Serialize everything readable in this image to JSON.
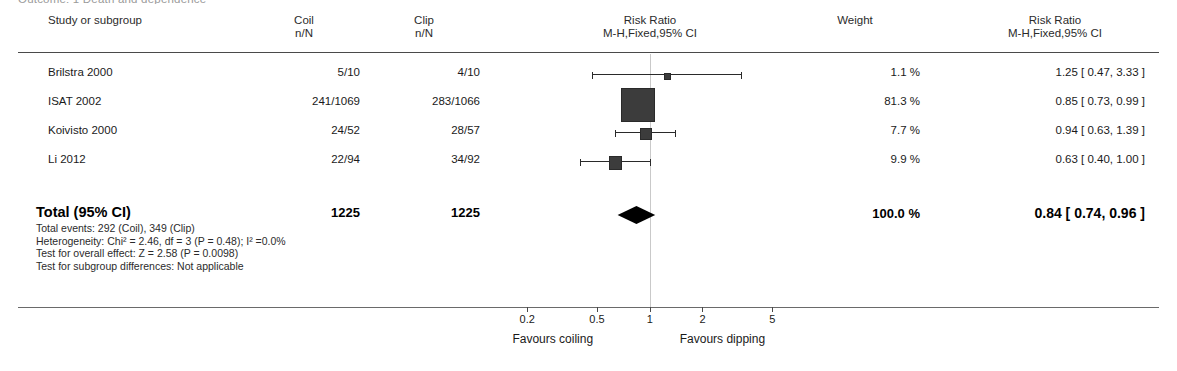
{
  "outcome_caption": "Outcome: 1 Death and dependence",
  "headers": {
    "study": "Study or subgroup",
    "coil_l1": "Coil",
    "coil_l2": "n/N",
    "clip_l1": "Clip",
    "clip_l2": "n/N",
    "plot_l1": "Risk Ratio",
    "plot_l2": "M-H,Fixed,95% CI",
    "weight": "Weight",
    "rr_l1": "Risk Ratio",
    "rr_l2": "M-H,Fixed,95% CI"
  },
  "rows": [
    {
      "study": "Brilstra 2000",
      "coil": "5/10",
      "clip": "4/10",
      "weight": "1.1 %",
      "rr_text": "1.25 [ 0.47, 3.33 ]",
      "estimate": 1.25,
      "ci_low": 0.47,
      "ci_high": 3.33,
      "weight_pct": 1.1
    },
    {
      "study": "ISAT 2002",
      "coil": "241/1069",
      "clip": "283/1066",
      "weight": "81.3 %",
      "rr_text": "0.85 [ 0.73, 0.99 ]",
      "estimate": 0.85,
      "ci_low": 0.73,
      "ci_high": 0.99,
      "weight_pct": 81.3
    },
    {
      "study": "Koivisto 2000",
      "coil": "24/52",
      "clip": "28/57",
      "weight": "7.7 %",
      "rr_text": "0.94 [ 0.63, 1.39 ]",
      "estimate": 0.94,
      "ci_low": 0.63,
      "ci_high": 1.39,
      "weight_pct": 7.7
    },
    {
      "study": "Li 2012",
      "coil": "22/94",
      "clip": "34/92",
      "weight": "9.9 %",
      "rr_text": "0.63 [ 0.40, 1.00 ]",
      "estimate": 0.63,
      "ci_low": 0.4,
      "ci_high": 1.0,
      "weight_pct": 9.9
    }
  ],
  "total": {
    "label": "Total (95% CI)",
    "coil_n": "1225",
    "clip_n": "1225",
    "weight": "100.0 %",
    "rr_text": "0.84 [ 0.74, 0.96 ]",
    "estimate": 0.84,
    "ci_low": 0.74,
    "ci_high": 0.96
  },
  "stats": [
    "Total events: 292 (Coil), 349 (Clip)",
    "Heterogeneity: Chi² = 2.46, df = 3 (P = 0.48); I² =0.0%",
    "Test for overall effect: Z = 2.58 (P = 0.0098)",
    "Test for subgroup differences: Not applicable"
  ],
  "axis": {
    "ticks": [
      "0.2",
      "0.5",
      "1",
      "2",
      "5"
    ],
    "tick_values": [
      0.2,
      0.5,
      1,
      2,
      5
    ],
    "favours_left": "Favours coiling",
    "favours_right": "Favours dipping",
    "scale": "log",
    "xmin": 0.14,
    "xmax": 7.2
  },
  "colors": {
    "marker": "#3c3c3c",
    "line": "#2a2a2a",
    "zeroline": "#c9c9c9",
    "rule": "#4a4a4a",
    "text": "#1a1a1a"
  },
  "chart_data": {
    "type": "scatter",
    "xlabel": "Risk Ratio (log scale)",
    "ylabel": "",
    "xlim": [
      0.14,
      7.2
    ],
    "grid": false,
    "legend": "none",
    "categories": [
      "Brilstra 2000",
      "ISAT 2002",
      "Koivisto 2000",
      "Li 2012",
      "Total (95% CI)"
    ],
    "values": [
      1.25,
      0.85,
      0.94,
      0.63,
      0.84
    ],
    "ci_low": [
      0.47,
      0.73,
      0.63,
      0.4,
      0.74
    ],
    "ci_high": [
      3.33,
      0.99,
      1.39,
      1.0,
      0.96
    ],
    "weights": [
      1.1,
      81.3,
      7.7,
      9.9,
      100.0
    ],
    "events_coil": [
      5,
      241,
      24,
      22,
      292
    ],
    "total_coil": [
      10,
      1069,
      52,
      94,
      1225
    ],
    "events_clip": [
      4,
      283,
      28,
      34,
      349
    ],
    "total_clip": [
      10,
      1066,
      57,
      92,
      1225
    ],
    "tick_labels": [
      "0.2",
      "0.5",
      "1",
      "2",
      "5"
    ],
    "reference_line": 1
  }
}
